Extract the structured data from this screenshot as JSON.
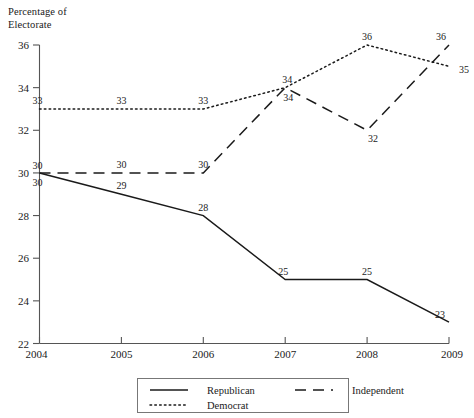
{
  "chart_data": {
    "type": "line",
    "title": "",
    "xlabel": "",
    "ylabel": "Percentage of\nElectorate",
    "x": [
      2004,
      2005,
      2006,
      2007,
      2008,
      2009
    ],
    "xtick_labels": [
      "2004",
      "2005",
      "2006",
      "2007",
      "2008",
      "2009"
    ],
    "ytick_labels": [
      "22",
      "24",
      "26",
      "28",
      "30",
      "32",
      "34",
      "36"
    ],
    "yticks": [
      22,
      24,
      26,
      28,
      30,
      32,
      34,
      36
    ],
    "ylim": [
      22,
      36
    ],
    "xlim": [
      2004,
      2009
    ],
    "grid": false,
    "legend_position": "bottom",
    "series": [
      {
        "name": "Republican",
        "style": "solid",
        "color": "#1a1a1a",
        "values": [
          30,
          29,
          28,
          25,
          25,
          23
        ],
        "point_labels": [
          "30",
          "29",
          "28",
          "25",
          "25",
          "23"
        ]
      },
      {
        "name": "Independent",
        "style": "dashed",
        "color": "#1a1a1a",
        "values": [
          30,
          30,
          30,
          34,
          32,
          36
        ],
        "point_labels": [
          "30",
          "30",
          "30",
          "34",
          "32",
          "36"
        ]
      },
      {
        "name": "Democrat",
        "style": "dotted",
        "color": "#1a1a1a",
        "values": [
          33,
          33,
          33,
          34,
          36,
          35
        ],
        "point_labels": [
          "33",
          "33",
          "33",
          "34",
          "36",
          "35"
        ]
      }
    ]
  },
  "legend": {
    "items": [
      {
        "label": "Republican",
        "style": "solid"
      },
      {
        "label": "Independent",
        "style": "dashed"
      },
      {
        "label": "Democrat",
        "style": "dotted"
      }
    ]
  }
}
